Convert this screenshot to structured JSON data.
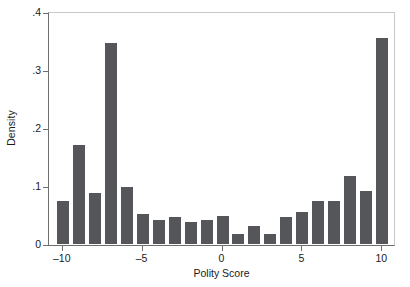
{
  "chart_data": {
    "type": "bar",
    "title": "",
    "subtitle": "",
    "xlabel": "Polity Score",
    "ylabel": "Density",
    "xlim": [
      -10.8,
      10.8
    ],
    "ylim": [
      0,
      0.4
    ],
    "grid": false,
    "legend": null,
    "bar_color": "#555659",
    "axis_color": "#6e6e6e",
    "frame_color": "#c9c9c9",
    "background": "#ffffff",
    "xticks": [
      -10,
      -5,
      0,
      5,
      10
    ],
    "xtick_labels": [
      "–10",
      "–5",
      "0",
      "5",
      "10"
    ],
    "yticks": [
      0,
      0.1,
      0.2,
      0.3,
      0.4
    ],
    "ytick_labels": [
      "0",
      ".1",
      ".2",
      ".3",
      ".4"
    ],
    "categories": [
      -10,
      -9,
      -8,
      -7,
      -6,
      -5,
      -4,
      -3,
      -2,
      -1,
      0,
      1,
      2,
      3,
      4,
      5,
      6,
      7,
      8,
      9,
      10
    ],
    "values": [
      0.075,
      0.17,
      0.088,
      0.347,
      0.099,
      0.052,
      0.042,
      0.047,
      0.038,
      0.042,
      0.049,
      0.018,
      0.031,
      0.018,
      0.047,
      0.056,
      0.075,
      0.074,
      0.118,
      0.091,
      0.356
    ],
    "bar_width": 0.75
  },
  "figure": {
    "y_axis_title": "Density",
    "x_axis_title": "Polity Score"
  }
}
